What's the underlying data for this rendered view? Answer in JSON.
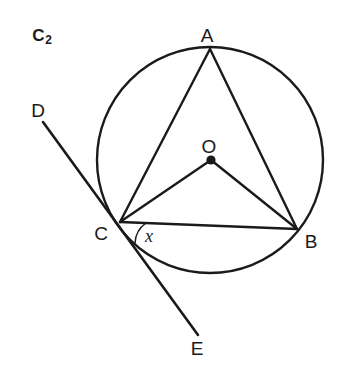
{
  "figure": {
    "id_label": "C",
    "id_subscript": "2",
    "stroke_color": "#1a1a1a",
    "background_color": "#ffffff",
    "width": 346,
    "height": 371
  },
  "labels": {
    "vertex_a": "A",
    "vertex_b": "B",
    "vertex_c": "C",
    "center_o": "O",
    "tangent_d": "D",
    "tangent_e": "E",
    "angle_x": "x"
  },
  "geometry": {
    "circle": {
      "cx": 210,
      "cy": 160,
      "r": 113
    },
    "points": {
      "A": {
        "x": 210,
        "y": 49
      },
      "B": {
        "x": 297,
        "y": 229
      },
      "C": {
        "x": 120,
        "y": 222
      },
      "O": {
        "x": 211,
        "y": 160
      },
      "D": {
        "x": 43,
        "y": 122
      },
      "E": {
        "x": 198,
        "y": 335
      }
    },
    "segments": [
      {
        "name": "chord-AC",
        "from": "A",
        "to": "C"
      },
      {
        "name": "chord-AB",
        "from": "A",
        "to": "B"
      },
      {
        "name": "chord-CB",
        "from": "C",
        "to": "B"
      },
      {
        "name": "radius-OC",
        "from": "O",
        "to": "C"
      },
      {
        "name": "radius-OB",
        "from": "O",
        "to": "B"
      },
      {
        "name": "tangent-DE",
        "from": "D",
        "to": "E"
      }
    ],
    "angle_arc": {
      "vertex": "C",
      "between": [
        "chord-CB",
        "tangent-CE"
      ],
      "radius": 26
    },
    "label_positions": {
      "A": {
        "x": 207,
        "y": 35
      },
      "B": {
        "x": 311,
        "y": 241
      },
      "C": {
        "x": 101,
        "y": 233
      },
      "O": {
        "x": 209,
        "y": 146
      },
      "D": {
        "x": 38,
        "y": 110
      },
      "E": {
        "x": 197,
        "y": 348
      },
      "x": {
        "x": 149,
        "y": 236
      },
      "figure_id": {
        "x": 42,
        "y": 35
      }
    }
  }
}
